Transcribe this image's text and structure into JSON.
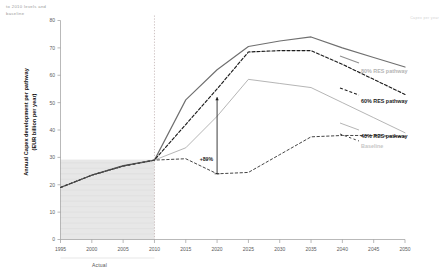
{
  "notes": {
    "top_left": "to 2010 levels and\nbaseline",
    "top_right": "Capex per year"
  },
  "legend": {
    "items": [
      {
        "label": "80% RES pathway",
        "color": "#a8a8a8",
        "style": "solid"
      },
      {
        "label": "60% RES pathway",
        "color": "#222222",
        "style": "dashed"
      },
      {
        "label": "40% RES pathway",
        "color": "#6e6e6e",
        "style": "solid-thin"
      },
      {
        "label": "Baseline",
        "color": "#bdbdbd",
        "style": "dashed-thin"
      }
    ]
  },
  "annotations": {
    "growth_label": "+89%",
    "actual_label": "Actual"
  },
  "chart_data": {
    "type": "line",
    "title": "",
    "xlabel": "",
    "ylabel": "Annual Capex development per pathway\n(EUR billion per year)",
    "xlim": [
      1995,
      2050
    ],
    "ylim": [
      0,
      80
    ],
    "yticks": [
      0,
      10,
      20,
      30,
      40,
      50,
      60,
      70,
      80
    ],
    "xticks": [
      1995,
      2000,
      2005,
      2010,
      2015,
      2020,
      2025,
      2030,
      2035,
      2040,
      2045,
      2050
    ],
    "grid": false,
    "legend_position": "right",
    "historical_end_year": 2010,
    "shaded_region": {
      "from": 1995,
      "to": 2010,
      "label": "Actual"
    },
    "series": [
      {
        "name": "80% RES pathway",
        "color": "#6f6f6f",
        "dash": "none",
        "width": 1.15,
        "x": [
          1995,
          2000,
          2005,
          2010,
          2015,
          2020,
          2025,
          2030,
          2035,
          2040,
          2045,
          2050
        ],
        "y": [
          19.0,
          23.5,
          27.0,
          29.0,
          51.0,
          62.0,
          70.5,
          72.5,
          74.0,
          70.0,
          66.5,
          63.0
        ]
      },
      {
        "name": "60% RES pathway",
        "color": "#1c1c1c",
        "dash": "3,2",
        "width": 1.15,
        "x": [
          1995,
          2000,
          2005,
          2010,
          2015,
          2020,
          2025,
          2030,
          2035,
          2040,
          2045,
          2050
        ],
        "y": [
          19.0,
          23.5,
          26.8,
          29.0,
          42.0,
          55.0,
          68.5,
          69.0,
          69.0,
          64.0,
          58.5,
          53.0
        ]
      },
      {
        "name": "40% RES pathway",
        "color": "#8c8c8c",
        "dash": "none",
        "width": 0.65,
        "x": [
          1995,
          2000,
          2005,
          2010,
          2015,
          2020,
          2025,
          2030,
          2035,
          2040,
          2045,
          2050
        ],
        "y": [
          19.0,
          23.5,
          26.8,
          29.0,
          33.5,
          45.0,
          58.5,
          57.0,
          55.5,
          50.0,
          44.5,
          39.0
        ]
      },
      {
        "name": "Baseline",
        "color": "#3a3a3a",
        "dash": "2.4,2.4",
        "width": 0.95,
        "x": [
          1995,
          2000,
          2005,
          2010,
          2015,
          2020,
          2025,
          2030,
          2035,
          2040,
          2045,
          2050
        ],
        "y": [
          19.0,
          23.5,
          26.8,
          29.0,
          29.5,
          24.0,
          24.5,
          31.0,
          37.5,
          38.0,
          38.0,
          37.5
        ]
      }
    ],
    "growth_arrow": {
      "x": 2020,
      "y_from": 24.0,
      "y_to": 52.0,
      "label": "+89%"
    }
  }
}
